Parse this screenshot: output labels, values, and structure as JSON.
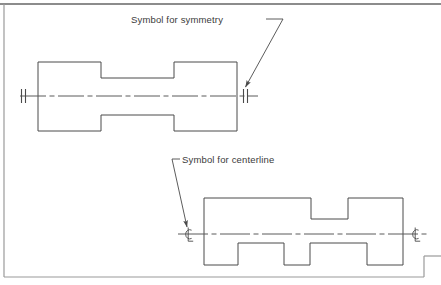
{
  "sheet": {
    "background_color": "#ffffff",
    "frame_color": "#8c8c8c",
    "line_color": "#4a4a4a",
    "centerline_color": "#5a5a5a",
    "text_color": "#3a3a3a"
  },
  "annotations": {
    "symmetry_label": "Symbol for symmetry",
    "centerline_label": "Symbol for centerline"
  },
  "symbols": {
    "symmetry_glyph": "symmetry-double-tick",
    "centerline_glyph": "℄"
  },
  "views": [
    {
      "name": "symmetric-dogbone-part",
      "annotation": "Symbol for symmetry",
      "symbol_type": "symmetry",
      "end_symbols": 2,
      "outline_points": "38,62 101,62 101,78 174,78 174,62 237,62 237,131 174,131 174,115 101,115 101,131 38,131",
      "centerline": {
        "x1": 20,
        "y1": 96,
        "x2": 258,
        "y2": 96
      }
    },
    {
      "name": "stepped-part",
      "annotation": "Symbol for centerline",
      "symbol_type": "centerline",
      "end_symbols": 2,
      "outline_points": "204,198 311,198 311,219 348,219 348,198 403,198 403,265 367,265 367,243 310,243 310,265 284,265 284,243 238,243 238,265 204,265",
      "centerline": {
        "x1": 178,
        "y1": 234,
        "x2": 427,
        "y2": 234
      }
    }
  ],
  "leaders": [
    {
      "name": "symmetry-leader",
      "for_label": "Symbol for symmetry",
      "path": "M 266,19 L 283,19 L 245,88",
      "arrow_at": {
        "x": 245,
        "y": 88
      }
    },
    {
      "name": "centerline-leader",
      "for_label": "Symbol for centerline",
      "path": "M 180,159 L 172,159 L 188,228",
      "arrow_at": {
        "x": 188,
        "y": 228
      }
    }
  ],
  "label_positions": {
    "symmetry": {
      "x": 131,
      "y": 23
    },
    "centerline": {
      "x": 182,
      "y": 163
    }
  }
}
